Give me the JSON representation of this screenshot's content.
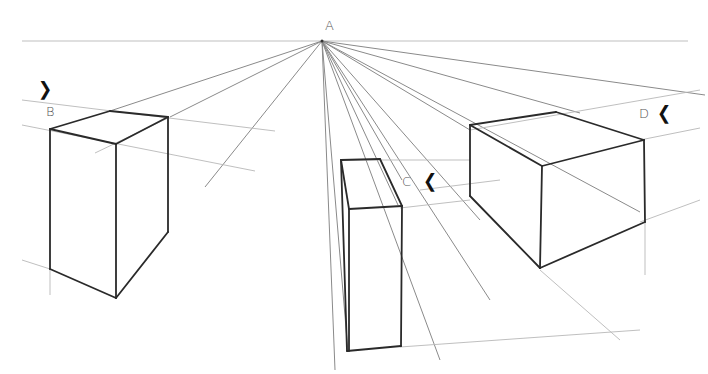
{
  "drawing": {
    "title": "One-point perspective boxes",
    "vanishing_point": {
      "x": 322,
      "y": 41
    },
    "labels": [
      {
        "id": "A",
        "text": "A",
        "x": 325,
        "y": 18
      },
      {
        "id": "B",
        "text": "B",
        "x": 46,
        "y": 104
      },
      {
        "id": "C",
        "text": "C",
        "x": 402,
        "y": 174
      },
      {
        "id": "D",
        "text": "D",
        "x": 639,
        "y": 106
      }
    ],
    "markers": [
      {
        "id": "marker-b",
        "glyph": "❯",
        "x": 38,
        "y": 78
      },
      {
        "id": "marker-c",
        "glyph": "❮",
        "x": 423,
        "y": 170
      },
      {
        "id": "marker-d",
        "glyph": "❮",
        "x": 657,
        "y": 102
      }
    ],
    "horizon": {
      "x1": 22,
      "y1": 41,
      "x2": 688,
      "y2": 41
    },
    "guides": [
      [
        322,
        41,
        110,
        111
      ],
      [
        322,
        41,
        170,
        117
      ],
      [
        322,
        41,
        205,
        187
      ],
      [
        322,
        41,
        580,
        113
      ],
      [
        322,
        41,
        705,
        95
      ],
      [
        322,
        41,
        470,
        130
      ],
      [
        322,
        41,
        480,
        220
      ],
      [
        322,
        41,
        490,
        300
      ],
      [
        322,
        41,
        440,
        360
      ],
      [
        322,
        41,
        640,
        212
      ],
      [
        322,
        41,
        335,
        370
      ],
      [
        322,
        41,
        348,
        352
      ],
      [
        322,
        41,
        398,
        205
      ],
      [
        322,
        41,
        402,
        180
      ],
      [
        22,
        100,
        275,
        131
      ],
      [
        22,
        125,
        255,
        171
      ],
      [
        95,
        153,
        168,
        118
      ],
      [
        22,
        260,
        50,
        269
      ],
      [
        340,
        160,
        470,
        160
      ],
      [
        400,
        208,
        470,
        200
      ],
      [
        420,
        190,
        500,
        180
      ],
      [
        470,
        130,
        700,
        90
      ],
      [
        640,
        140,
        700,
        128
      ],
      [
        640,
        222,
        700,
        200
      ],
      [
        400,
        347,
        640,
        330
      ],
      [
        50,
        269,
        50,
        295
      ],
      [
        645,
        222,
        645,
        275
      ],
      [
        540,
        270,
        620,
        340
      ]
    ],
    "boxes": {
      "B": {
        "edges": [
          [
            50,
            129,
            110,
            111
          ],
          [
            110,
            111,
            168,
            117
          ],
          [
            168,
            117,
            116,
            144
          ],
          [
            116,
            144,
            50,
            129
          ],
          [
            50,
            129,
            50,
            269
          ],
          [
            116,
            144,
            116,
            298
          ],
          [
            168,
            117,
            168,
            232
          ],
          [
            50,
            269,
            116,
            298
          ],
          [
            116,
            298,
            168,
            232
          ]
        ]
      },
      "C": {
        "edges": [
          [
            341,
            160,
            380,
            159
          ],
          [
            380,
            159,
            402,
            206
          ],
          [
            402,
            206,
            349,
            209
          ],
          [
            349,
            209,
            341,
            160
          ],
          [
            341,
            160,
            347,
            351
          ],
          [
            349,
            209,
            349,
            351
          ],
          [
            402,
            206,
            401,
            346
          ],
          [
            347,
            351,
            401,
            346
          ]
        ]
      },
      "D": {
        "edges": [
          [
            470,
            125,
            556,
            112
          ],
          [
            556,
            112,
            644,
            140
          ],
          [
            644,
            140,
            542,
            166
          ],
          [
            542,
            166,
            470,
            125
          ],
          [
            470,
            125,
            470,
            196
          ],
          [
            542,
            166,
            540,
            268
          ],
          [
            644,
            140,
            645,
            222
          ],
          [
            470,
            196,
            540,
            268
          ],
          [
            540,
            268,
            645,
            222
          ]
        ]
      }
    }
  }
}
